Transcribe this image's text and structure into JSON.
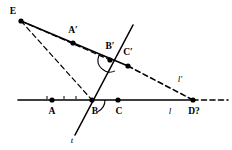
{
  "figure": {
    "width": 232,
    "height": 150,
    "background": "#ffffff",
    "ink": "#000000"
  },
  "points": [
    {
      "id": "E",
      "label": "E",
      "x": 21,
      "y": 21,
      "label_x": 13,
      "label_y": 12,
      "dot": true
    },
    {
      "id": "Ap",
      "label": "A′",
      "x": 73,
      "y": 43,
      "label_x": 73,
      "label_y": 31,
      "dot": true
    },
    {
      "id": "Bp",
      "label": "B′",
      "x": 110,
      "y": 60,
      "label_x": 110,
      "label_y": 47,
      "dot": true
    },
    {
      "id": "Cp",
      "label": "C′",
      "x": 128,
      "y": 66,
      "label_x": 128,
      "label_y": 53,
      "dot": true
    },
    {
      "id": "A",
      "label": "A",
      "x": 52,
      "y": 100,
      "label_x": 52,
      "label_y": 112,
      "dot": true
    },
    {
      "id": "B",
      "label": "B",
      "x": 92,
      "y": 100,
      "label_x": 95,
      "label_y": 112,
      "dot": true
    },
    {
      "id": "C",
      "label": "C",
      "x": 118,
      "y": 100,
      "label_x": 119,
      "label_y": 112,
      "dot": true
    },
    {
      "id": "D",
      "label": "D?",
      "x": 193,
      "y": 100,
      "label_x": 194,
      "label_y": 112,
      "dot": true
    }
  ],
  "line_labels": [
    {
      "id": "l",
      "label": "l",
      "x": 170,
      "y": 111
    },
    {
      "id": "l-prime",
      "label": "l′",
      "x": 180,
      "y": 79
    },
    {
      "id": "t",
      "label": "t",
      "x": 72,
      "y": 140
    }
  ],
  "segments": {
    "line_l_solid": {
      "x1": 18,
      "y1": 100,
      "x2": 193,
      "y2": 100,
      "style": "solid",
      "width": 1.6
    },
    "line_l_dashed": {
      "x1": 193,
      "y1": 100,
      "x2": 228,
      "y2": 100,
      "style": "dashed",
      "width": 1.6
    },
    "line_t": {
      "x1": 75,
      "y1": 135,
      "x2": 133,
      "y2": 25,
      "style": "solid",
      "width": 1.6
    },
    "line_lp_solid": {
      "x1": 21,
      "y1": 21,
      "x2": 128,
      "y2": 66,
      "style": "solid",
      "width": 1.6
    },
    "line_lp_dashed": {
      "x1": 128,
      "y1": 66,
      "x2": 193,
      "y2": 100,
      "style": "dashed",
      "width": 1.6
    },
    "ray_E_B": {
      "x1": 21,
      "y1": 21,
      "x2": 92,
      "y2": 100,
      "style": "dashed",
      "width": 1.2
    },
    "ray_E_Bp": {
      "x1": 21,
      "y1": 21,
      "x2": 110,
      "y2": 60,
      "style": "dashed",
      "width": 1.2
    }
  },
  "tick_marks": [
    {
      "id": "tick-A-left",
      "x": 47,
      "y": 96
    },
    {
      "id": "tick-A-right",
      "x": 64,
      "y": 96
    },
    {
      "id": "tick-B-left",
      "x": 76,
      "y": 96
    }
  ],
  "angle_arcs": [
    {
      "id": "arc-at-B-prime",
      "cx": 110,
      "cy": 60,
      "r": 12,
      "start_deg": 158,
      "end_deg": 295
    },
    {
      "id": "arc-at-B",
      "cx": 92,
      "cy": 100,
      "r": 13,
      "start_deg": 0,
      "end_deg": -62
    }
  ]
}
